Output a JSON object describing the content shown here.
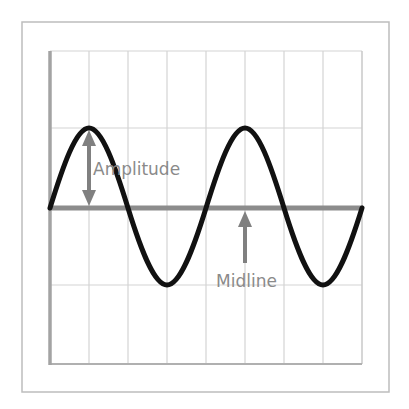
{
  "diagram": {
    "labels": {
      "amplitude": "Amplitude",
      "midline": "Midline"
    },
    "colors": {
      "background": "#ffffff",
      "frame": "#bdbdbd",
      "grid": "#d4d4d4",
      "axis": "#a3a3a3",
      "midline": "#8c8c8c",
      "curve": "#111111",
      "arrow": "#808080",
      "label_text": "#8a8a8a"
    },
    "grid": {
      "columns": 8,
      "rows": 4
    },
    "wave": {
      "crests": 2,
      "troughs": 2
    }
  }
}
